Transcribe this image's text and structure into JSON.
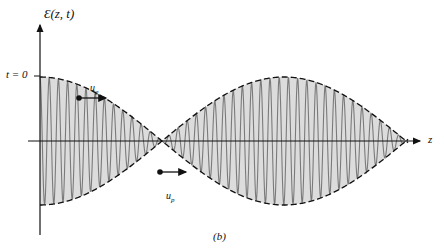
{
  "figure": {
    "y_axis_label": "Ɛ(z, t)",
    "time_label": "t = 0",
    "x_axis_label": "z",
    "group_velocity_label": "u",
    "group_velocity_sub": "g",
    "phase_velocity_label": "u",
    "phase_velocity_sub": "p",
    "caption": "(b)"
  },
  "colors": {
    "fill": "#dcdcdc",
    "carrier": "#7a7a7a",
    "envelope": "#111111",
    "axis": "#111111"
  },
  "geometry": {
    "axis_y": 141,
    "axis_x_start": 28,
    "axis_x_end": 420,
    "y_axis_x": 40,
    "y_axis_top": 25,
    "y_axis_bottom": 235,
    "amplitude": 64,
    "envelope_start_x": 40,
    "envelope_end_x": 408,
    "envelope_period": 244,
    "envelope_phase_x": 40,
    "carrier_period": 9.2
  }
}
